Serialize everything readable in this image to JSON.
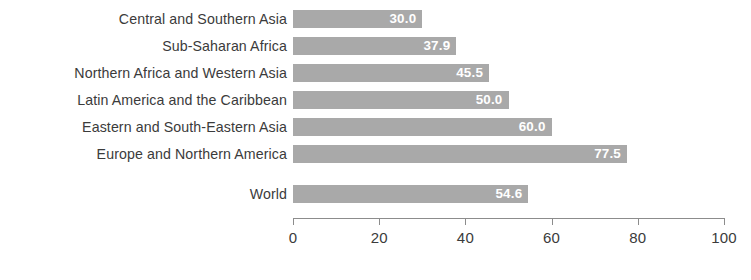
{
  "chart_data": {
    "type": "bar",
    "orientation": "horizontal",
    "title": "",
    "subtitle": "",
    "xlabel": "",
    "ylabel": "",
    "xlim": [
      0,
      100
    ],
    "grid": false,
    "legend": null,
    "bar_color": "#a9a9a9",
    "label_color": "#3b3b3b",
    "value_label_color": "#ffffff",
    "axis_color": "#8c8c8c",
    "categories": [
      "Central and Southern Asia",
      "Sub-Saharan Africa",
      "Northern Africa and Western Asia",
      "Latin America and the Caribbean",
      "Eastern and South-Eastern Asia",
      "Europe and Northern America",
      "World"
    ],
    "values": [
      30.0,
      37.9,
      45.5,
      50.0,
      60.0,
      77.5,
      54.6
    ],
    "value_labels": [
      "30.0",
      "37.9",
      "45.5",
      "50.0",
      "60.0",
      "77.5",
      "54.6"
    ],
    "separated_index": 6,
    "ticks": [
      0,
      20,
      40,
      60,
      80,
      100
    ],
    "tick_labels": [
      "0",
      "20",
      "40",
      "60",
      "80",
      "100"
    ]
  }
}
